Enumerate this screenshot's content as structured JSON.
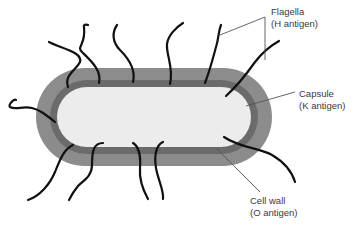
{
  "diagram": {
    "colors": {
      "capsule": "#8c8c8c",
      "cell_wall": "#6b6b6b",
      "cytoplasm": "#ececec",
      "flagella": "#111111",
      "leader_lines": "#555555",
      "label_text": "#3a3a3a"
    },
    "labels": {
      "flagella": {
        "name": "Flagella",
        "antigen": "(H antigen)"
      },
      "capsule": {
        "name": "Capsule",
        "antigen": "(K antigen)"
      },
      "cell_wall": {
        "name": "Cell wall",
        "antigen": "(O antigen)"
      }
    },
    "flagella_count": 12
  }
}
